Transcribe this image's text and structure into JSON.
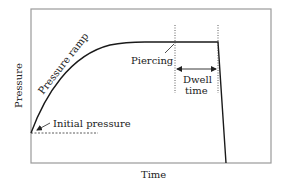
{
  "diagram": {
    "type": "line-schematic",
    "axes": {
      "xlabel": "Time",
      "ylabel": "Pressure"
    },
    "annotations": {
      "pressure_ramp": "Pressure ramp",
      "piercing": "Piercing",
      "dwell_line1": "Dwell",
      "dwell_line2": "time",
      "initial_pressure": "Initial pressure"
    },
    "colors": {
      "curve": "#1a1a1a",
      "frame": "#9a9a9a",
      "text": "#222222"
    }
  }
}
